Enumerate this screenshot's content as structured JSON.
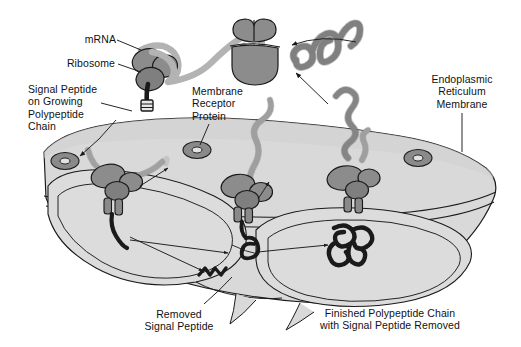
{
  "figure": {
    "width": 521,
    "height": 347,
    "background": "#ffffff"
  },
  "palette": {
    "background": "#ffffff",
    "membrane_fill": "#d9d9d9",
    "lumen_fill": "#dcdcdc",
    "ribosome_fill": "#8c8c8c",
    "ribosome_fill_dark": "#7a7a7a",
    "receptor_fill": "#8a8a8a",
    "receptor_hole": "#e2e2e2",
    "mrna_fill": "#b3b3b3",
    "polypeptide_fill": "#a8a8a8",
    "signal_peptide": "#1d1d1d",
    "outline": "#1a1a1a",
    "leader_line": "#1a1a1a",
    "text": "#111111"
  },
  "labels": [
    {
      "id": "mrna",
      "name": "mrna-label",
      "text": "mRNA",
      "align": "right",
      "x": 112,
      "y": 33,
      "leader": {
        "from": [
          116,
          41
        ],
        "to": [
          141,
          50
        ]
      }
    },
    {
      "id": "ribosome",
      "name": "ribosome-label",
      "text": "Ribosome",
      "align": "right",
      "x": 113,
      "y": 57,
      "leader": {
        "from": [
          117,
          65
        ],
        "to": [
          140,
          72
        ]
      }
    },
    {
      "id": "signal-peptide-growing",
      "name": "signal-peptide-on-growing-chain-label",
      "text": "Signal Peptide\non Growing\nPolypeptide\nChain",
      "align": "left",
      "x": 28,
      "y": 83,
      "leader": {
        "from": [
          100,
          103
        ],
        "to": [
          130,
          110
        ]
      }
    },
    {
      "id": "membrane-receptor",
      "name": "membrane-receptor-protein-label",
      "text": "Membrane\nReceptor\nProtein",
      "align": "left",
      "x": 192,
      "y": 85,
      "leader": {
        "from": [
          209,
          125
        ],
        "to": [
          201,
          147
        ]
      }
    },
    {
      "id": "er-membrane",
      "name": "endoplasmic-reticulum-membrane-label",
      "text": "Endoplasmic\nReticulum\nMembrane",
      "align": "center",
      "x": 462,
      "y": 73,
      "leader": {
        "from": [
          462,
          113
        ],
        "to": [
          462,
          150
        ]
      }
    },
    {
      "id": "removed-signal-peptide",
      "name": "removed-signal-peptide-label",
      "text": "Removed\nSignal Peptide",
      "align": "center",
      "x": 179,
      "y": 308,
      "leader": {
        "from": [
          203,
          305
        ],
        "to": [
          231,
          277
        ]
      }
    },
    {
      "id": "finished-chain",
      "name": "finished-polypeptide-chain-label",
      "text": "Finished Polypeptide Chain\nwith Signal Peptide Removed",
      "align": "center",
      "x": 390,
      "y": 307,
      "leader": null
    }
  ],
  "structures": {
    "free_ribosome": {
      "name": "free-cytosolic-ribosome",
      "description": "Ribosome with mRNA threaded through, synthesizing a polypeptide chain with signal peptide at top left",
      "center": [
        150,
        72
      ]
    },
    "dissociated_subunits": {
      "name": "dissociated-ribosome-subunits",
      "description": "Small bilobed ribosomal subunit above and large dome-shaped subunit below, released after translation",
      "small_subunit_center": [
        253,
        30
      ],
      "large_subunit_center": [
        255,
        63
      ]
    },
    "released_polypeptide": {
      "name": "released-folded-polypeptide",
      "description": "Coiled free polypeptide chain released into the ER lumen, top right",
      "center": [
        322,
        52
      ]
    },
    "membrane_ribosomes": [
      {
        "name": "membrane-bound-ribosome-left",
        "center": [
          113,
          178
        ],
        "description": "Ribosome docked on ER membrane, signal peptide entering translocon"
      },
      {
        "name": "membrane-bound-ribosome-middle",
        "center": [
          244,
          188
        ],
        "description": "Ribosome docked on ER membrane with nascent chain threading through"
      },
      {
        "name": "membrane-bound-ribosome-right",
        "center": [
          352,
          183
        ],
        "description": "Ribosome docked on ER membrane releasing finished chain into lumen"
      }
    ],
    "receptors": [
      {
        "name": "membrane-receptor-ring-left",
        "center": [
          65,
          161
        ]
      },
      {
        "name": "membrane-receptor-ring-middle",
        "center": [
          197,
          150
        ]
      },
      {
        "name": "membrane-receptor-ring-right",
        "center": [
          418,
          158
        ]
      }
    ],
    "cleaved_signal_peptide": {
      "name": "cleaved-signal-peptide-fragment",
      "center": [
        208,
        272
      ],
      "description": "Small dark zigzag fragment of removed signal peptide inside the ER lumen"
    },
    "finished_polypeptide": {
      "name": "finished-folded-polypeptide-in-lumen",
      "center": [
        348,
        243
      ],
      "description": "Folded mature polypeptide inside ER lumen with signal peptide removed"
    }
  },
  "arrows": [
    {
      "name": "arrow-subunits-to-ribosome",
      "from": [
        355,
        42
      ],
      "to": [
        288,
        48
      ],
      "description": "Recycling of ribosomal subunits"
    },
    {
      "name": "arrow-chain-release-to-lumen",
      "from": [
        327,
        103
      ],
      "to": [
        293,
        72
      ],
      "description": "Released polypeptide folds"
    },
    {
      "name": "arrow-signal-peptide-entry",
      "from": [
        112,
        118
      ],
      "to": [
        78,
        158
      ],
      "description": "Signal peptide binds receptor"
    },
    {
      "name": "arrow-left-ribosome-chain",
      "from": [
        137,
        185
      ],
      "to": [
        168,
        167
      ],
      "description": "Chain elongation through translocon"
    },
    {
      "name": "arrow-to-removed-peptide-a",
      "from": [
        130,
        237
      ],
      "to": [
        205,
        270
      ],
      "description": "Signal peptide cleaved"
    },
    {
      "name": "arrow-to-removed-peptide-b",
      "from": [
        130,
        239
      ],
      "to": [
        232,
        253
      ],
      "description": "Signal peptide cleaved"
    },
    {
      "name": "arrow-finished-chain",
      "from": [
        258,
        251
      ],
      "to": [
        330,
        245
      ],
      "description": "Finished chain in lumen"
    },
    {
      "name": "arrow-middle-chain-up",
      "from": [
        258,
        198
      ],
      "to": [
        268,
        180
      ],
      "description": "Nascent chain direction"
    }
  ]
}
